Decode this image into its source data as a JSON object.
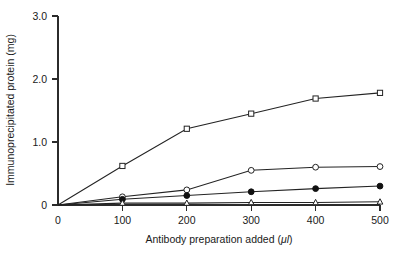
{
  "chart_data": {
    "type": "line",
    "title": "",
    "xlabel": "Antibody preparation added (μl)",
    "ylabel": "Immunoprecipitated protein (mg)",
    "xlim": [
      0,
      500
    ],
    "ylim": [
      0,
      3.0
    ],
    "xticks": [
      0,
      100,
      200,
      300,
      400,
      500
    ],
    "xtick_labels": [
      "0",
      "100",
      "200",
      "300",
      "400",
      "500"
    ],
    "yticks": [
      0,
      1.0,
      2.0,
      3.0
    ],
    "ytick_labels": [
      "0",
      "1.0",
      "2.0",
      "3.0"
    ],
    "grid": false,
    "legend": "none",
    "x": [
      0,
      100,
      200,
      300,
      400,
      500
    ],
    "series": [
      {
        "name": "series-1-open-square",
        "marker": "open-square",
        "color": "#232323",
        "values": [
          0.0,
          0.62,
          1.21,
          1.45,
          1.69,
          1.78
        ]
      },
      {
        "name": "series-2-open-circle",
        "marker": "open-circle",
        "color": "#232323",
        "values": [
          0.0,
          0.13,
          0.24,
          0.55,
          0.6,
          0.61
        ]
      },
      {
        "name": "series-3-filled-circle",
        "marker": "filled-circle",
        "color": "#111111",
        "values": [
          0.0,
          0.09,
          0.15,
          0.21,
          0.26,
          0.3
        ]
      },
      {
        "name": "series-4-open-triangle",
        "marker": "open-triangle",
        "color": "#232323",
        "values": [
          0.0,
          0.03,
          0.03,
          0.04,
          0.04,
          0.05
        ]
      }
    ]
  },
  "figure": {
    "background_color": "#ffffff",
    "axis_color": "#2b2b2b",
    "x_axis_title": "Antibody preparation added (",
    "x_axis_unit": "μl",
    "x_axis_title_close": ")",
    "y_axis_title": "Immunoprecipitated protein (mg)"
  }
}
